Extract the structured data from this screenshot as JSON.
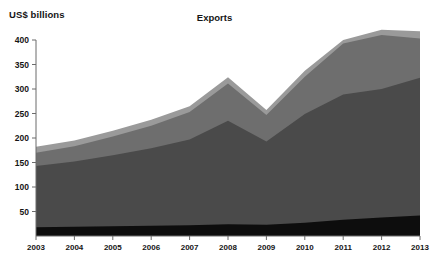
{
  "chart_data": {
    "type": "area",
    "title": "Exports",
    "xlabel": "",
    "ylabel": "US$ billions",
    "ylim": [
      0,
      420
    ],
    "xlim": [
      2003,
      2013
    ],
    "grid": false,
    "legend": "none",
    "stacked": true,
    "categories": [
      "2003",
      "2004",
      "2005",
      "2006",
      "2007",
      "2008",
      "2009",
      "2010",
      "2011",
      "2012",
      "2013"
    ],
    "x": [
      2003,
      2004,
      2005,
      2006,
      2007,
      2008,
      2009,
      2010,
      2011,
      2012,
      2013
    ],
    "yticks": [
      50,
      100,
      150,
      200,
      250,
      300,
      350,
      400
    ],
    "ytick_labels": [
      "50",
      "100",
      "150",
      "200",
      "250",
      "300",
      "350",
      "400"
    ],
    "series": [
      {
        "name": "series-1",
        "color": "#0d0d0d",
        "values": [
          18,
          19,
          20,
          21,
          22,
          24,
          23,
          27,
          33,
          38,
          42
        ]
      },
      {
        "name": "series-2",
        "color": "#4a4a4a",
        "values": [
          125,
          133,
          145,
          158,
          175,
          211,
          170,
          222,
          256,
          262,
          281
        ]
      },
      {
        "name": "series-3",
        "color": "#6e6e6e",
        "values": [
          27,
          31,
          38,
          46,
          56,
          76,
          54,
          76,
          104,
          110,
          80
        ]
      },
      {
        "name": "series-4",
        "color": "#9a9a9a",
        "values": [
          12,
          12,
          12,
          12,
          12,
          13,
          10,
          12,
          7,
          11,
          15
        ]
      }
    ],
    "totals": [
      182,
      195,
      215,
      237,
      265,
      324,
      257,
      337,
      400,
      421,
      418
    ]
  },
  "axis": {
    "y_axis_title": "US$ billions"
  }
}
